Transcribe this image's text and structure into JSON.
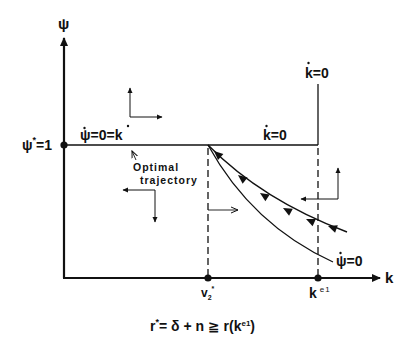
{
  "diagram": {
    "type": "phase-diagram",
    "axes": {
      "y_label": "ψ",
      "x_label": "k"
    },
    "labels": {
      "psi_star": "ψ*=1",
      "psi_star_main": "ψ",
      "psi_star_sup": "*",
      "psi_star_eq": "=1",
      "psi_dot_zero_eq_k_dot": "ψ̇=0=k̇",
      "psi_dot_zero_eq_k_dot_a": "ψ",
      "psi_dot_zero_eq_k_dot_b": "=0=",
      "psi_dot_zero_eq_k_dot_c": "k",
      "k_dot_zero_horizontal": "k̇=0",
      "k_dot_zero_vertical": "k̇=0",
      "k_letter": "k",
      "eq_zero": "=0",
      "psi_letter": "ψ",
      "psi_dot_zero_curve": "ψ̇=0",
      "optimal_line1": "Optimal",
      "optimal_line2": "trajectory",
      "v2_star_main": "v",
      "v2_star_sub": "2",
      "v2_star_sup": "*",
      "k_e1_main": "k",
      "k_e1_sup": "e1"
    },
    "formula": {
      "text": "r* = δ + n ≧ r(k^e1)",
      "r": "r",
      "star": "*",
      "middle": "= δ + n ≧ r(k",
      "sup": "e1",
      "close": ")"
    },
    "points": [
      {
        "name": "psi-star",
        "x": 0,
        "y": 1
      },
      {
        "name": "v2-star",
        "x": "v2*",
        "y": 0
      },
      {
        "name": "k-e1",
        "x": "k^e1",
        "y": 0
      }
    ],
    "colors": {
      "ink": "#111111",
      "background": "#ffffff"
    }
  }
}
